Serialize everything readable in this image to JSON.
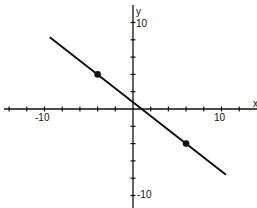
{
  "chart_data": {
    "type": "line",
    "title": "",
    "xlabel": "x",
    "ylabel": "y",
    "xlim": [
      -14,
      14
    ],
    "ylim": [
      -12,
      12
    ],
    "x_tick_step": 2,
    "y_tick_step": 2,
    "x_tick_labels": [
      {
        "value": -10,
        "label": "-10"
      },
      {
        "value": 10,
        "label": "10"
      }
    ],
    "y_tick_labels": [
      {
        "value": 10,
        "label": "10"
      },
      {
        "value": -10,
        "label": "-10"
      }
    ],
    "grid": false,
    "series": [
      {
        "name": "line",
        "equation": "y = -0.8x + 0.8",
        "x": [
          -9.4,
          10.5
        ],
        "y": [
          8.3,
          -7.6
        ]
      }
    ],
    "points": [
      {
        "x": -4,
        "y": 4
      },
      {
        "x": 6,
        "y": -4
      }
    ],
    "colors": {
      "ink": "#111111",
      "background": "#ffffff"
    }
  },
  "labels": {
    "x_axis": "x",
    "y_axis": "y",
    "x_neg10": "-10",
    "x_pos10": "10",
    "y_pos10": "10",
    "y_neg10": "-10"
  }
}
